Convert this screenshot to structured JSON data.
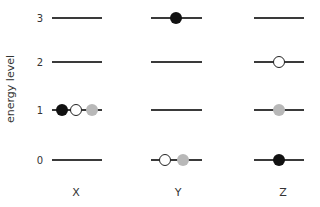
{
  "diagram": {
    "ylabel": "energy level",
    "levels": [
      {
        "label": "0",
        "y": 160
      },
      {
        "label": "1",
        "y": 110
      },
      {
        "label": "2",
        "y": 62
      },
      {
        "label": "3",
        "y": 18
      }
    ],
    "columns": [
      {
        "label": "X",
        "x1": 52,
        "x2": 102,
        "cx": 77
      },
      {
        "label": "Y",
        "x1": 151,
        "x2": 202,
        "cx": 177
      },
      {
        "label": "Z",
        "x1": 254,
        "x2": 304,
        "cx": 279
      }
    ],
    "particles": [
      {
        "column": "X",
        "level": 1,
        "color": "black",
        "x": 62
      },
      {
        "column": "X",
        "level": 1,
        "color": "white",
        "x": 76
      },
      {
        "column": "X",
        "level": 1,
        "color": "gray",
        "x": 92
      },
      {
        "column": "Y",
        "level": 3,
        "color": "black",
        "x": 176
      },
      {
        "column": "Y",
        "level": 0,
        "color": "white",
        "x": 165
      },
      {
        "column": "Y",
        "level": 0,
        "color": "gray",
        "x": 183
      },
      {
        "column": "Z",
        "level": 2,
        "color": "white",
        "x": 279
      },
      {
        "column": "Z",
        "level": 1,
        "color": "gray",
        "x": 279
      },
      {
        "column": "Z",
        "level": 0,
        "color": "black",
        "x": 279
      }
    ],
    "colors": {
      "black": "#111111",
      "white": "#ffffff",
      "gray": "#b8b8b8",
      "line": "#3a3a3a"
    }
  }
}
